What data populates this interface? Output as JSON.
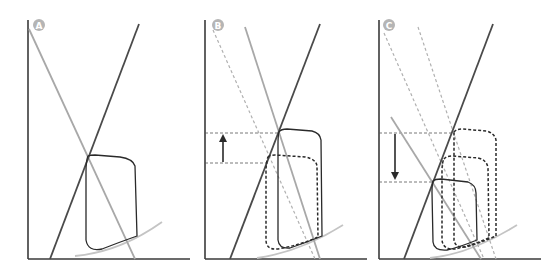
{
  "figure": {
    "panels": [
      {
        "id": "A",
        "label": "A",
        "description": "Baseline pressure-volume loop with ESPVR (dark) and arterial elastance (gray) lines"
      },
      {
        "id": "B",
        "label": "B",
        "description": "Shift of arterial elastance line; end-systolic pressure increases (up arrow)"
      },
      {
        "id": "C",
        "label": "C",
        "description": "Shift of arterial elastance line; end-systolic pressure decreases (down arrow)"
      }
    ],
    "colors": {
      "axis": "#3a3a3a",
      "dark_line": "#4a4a4a",
      "gray_line": "#a8a8a8",
      "dashed_line": "#b0b0b0",
      "loop": "#2a2a2a",
      "edpvr_curve": "#c4c4c4",
      "badge": "#b5b5b5"
    },
    "arrows": {
      "B": "up",
      "C": "down"
    }
  }
}
